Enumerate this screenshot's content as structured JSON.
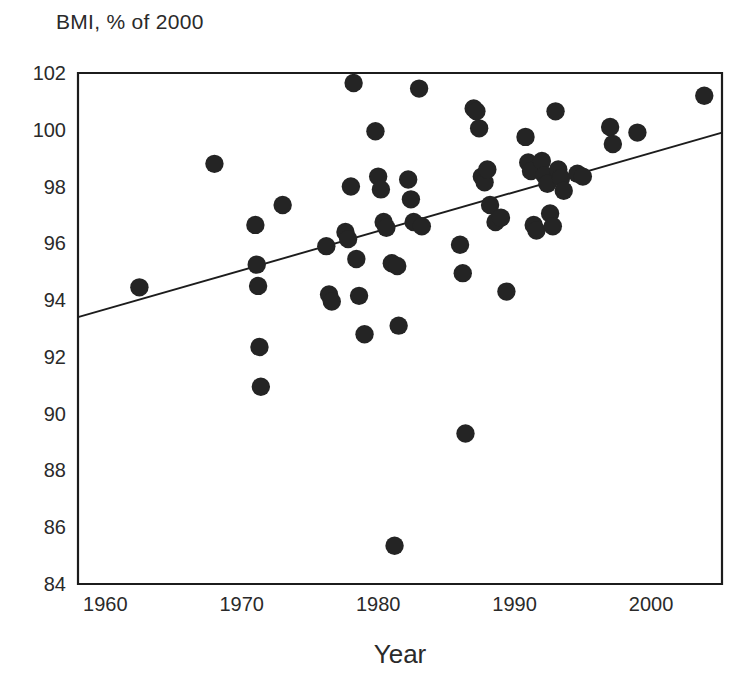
{
  "chart_data": {
    "type": "scatter",
    "title": "BMI, % of 2000",
    "xlabel": "Year",
    "ylabel": "BMI, % of 2000",
    "xlim": [
      1958.0,
      2005.2
    ],
    "ylim": [
      84,
      102
    ],
    "xticks": [
      1960,
      1970,
      1980,
      1990,
      2000
    ],
    "xticklabels": [
      "1960",
      "1970",
      "1980",
      "1990",
      "2000"
    ],
    "yticks": [
      84,
      86,
      88,
      90,
      92,
      94,
      96,
      98,
      100,
      102
    ],
    "yticklabels": [
      "84",
      "86",
      "88",
      "90",
      "92",
      "94",
      "96",
      "98",
      "100",
      "102"
    ],
    "grid": false,
    "legend": null,
    "marker": "filled-circle",
    "marker_color": "#242424",
    "trendline": {
      "type": "linear-fit",
      "x_start": 1958.0,
      "y_start": 93.4,
      "x_end": 2005.2,
      "y_end": 99.9,
      "color": "#1c1c1c"
    },
    "points": [
      {
        "x": 1962.5,
        "y": 94.45
      },
      {
        "x": 1968.0,
        "y": 98.8
      },
      {
        "x": 1971.0,
        "y": 96.65
      },
      {
        "x": 1971.1,
        "y": 95.25
      },
      {
        "x": 1971.2,
        "y": 94.5
      },
      {
        "x": 1971.3,
        "y": 92.35
      },
      {
        "x": 1971.4,
        "y": 90.95
      },
      {
        "x": 1973.0,
        "y": 97.35
      },
      {
        "x": 1976.2,
        "y": 95.9
      },
      {
        "x": 1976.4,
        "y": 94.2
      },
      {
        "x": 1976.6,
        "y": 93.95
      },
      {
        "x": 1977.6,
        "y": 96.4
      },
      {
        "x": 1977.8,
        "y": 96.15
      },
      {
        "x": 1978.0,
        "y": 98.0
      },
      {
        "x": 1978.2,
        "y": 101.65
      },
      {
        "x": 1978.4,
        "y": 95.45
      },
      {
        "x": 1978.6,
        "y": 94.15
      },
      {
        "x": 1979.0,
        "y": 92.8
      },
      {
        "x": 1979.8,
        "y": 99.95
      },
      {
        "x": 1980.0,
        "y": 98.35
      },
      {
        "x": 1980.2,
        "y": 97.9
      },
      {
        "x": 1980.4,
        "y": 96.75
      },
      {
        "x": 1980.6,
        "y": 96.55
      },
      {
        "x": 1981.0,
        "y": 95.3
      },
      {
        "x": 1981.4,
        "y": 95.2
      },
      {
        "x": 1981.5,
        "y": 93.1
      },
      {
        "x": 1981.2,
        "y": 85.35
      },
      {
        "x": 1982.2,
        "y": 98.25
      },
      {
        "x": 1982.4,
        "y": 97.55
      },
      {
        "x": 1982.6,
        "y": 96.75
      },
      {
        "x": 1983.0,
        "y": 101.45
      },
      {
        "x": 1983.2,
        "y": 96.6
      },
      {
        "x": 1986.0,
        "y": 95.95
      },
      {
        "x": 1986.2,
        "y": 94.95
      },
      {
        "x": 1986.4,
        "y": 89.3
      },
      {
        "x": 1987.0,
        "y": 100.75
      },
      {
        "x": 1987.2,
        "y": 100.65
      },
      {
        "x": 1987.4,
        "y": 100.05
      },
      {
        "x": 1987.6,
        "y": 98.35
      },
      {
        "x": 1987.8,
        "y": 98.15
      },
      {
        "x": 1988.0,
        "y": 98.6
      },
      {
        "x": 1988.2,
        "y": 97.35
      },
      {
        "x": 1988.6,
        "y": 96.75
      },
      {
        "x": 1989.0,
        "y": 96.9
      },
      {
        "x": 1989.4,
        "y": 94.3
      },
      {
        "x": 1990.8,
        "y": 99.75
      },
      {
        "x": 1991.0,
        "y": 98.85
      },
      {
        "x": 1991.2,
        "y": 98.55
      },
      {
        "x": 1991.4,
        "y": 96.65
      },
      {
        "x": 1991.6,
        "y": 96.45
      },
      {
        "x": 1992.0,
        "y": 98.9
      },
      {
        "x": 1992.2,
        "y": 98.4
      },
      {
        "x": 1992.4,
        "y": 98.1
      },
      {
        "x": 1992.6,
        "y": 97.05
      },
      {
        "x": 1992.8,
        "y": 96.6
      },
      {
        "x": 1993.0,
        "y": 100.65
      },
      {
        "x": 1993.2,
        "y": 98.6
      },
      {
        "x": 1993.4,
        "y": 98.3
      },
      {
        "x": 1993.6,
        "y": 97.85
      },
      {
        "x": 1994.6,
        "y": 98.45
      },
      {
        "x": 1995.0,
        "y": 98.35
      },
      {
        "x": 1997.0,
        "y": 100.1
      },
      {
        "x": 1997.2,
        "y": 99.5
      },
      {
        "x": 1999.0,
        "y": 99.9
      },
      {
        "x": 2003.9,
        "y": 101.2
      }
    ]
  }
}
